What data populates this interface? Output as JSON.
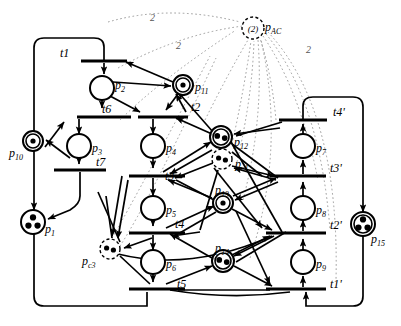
{
  "figure": {
    "kind": "petri-net",
    "width": 401,
    "height": 326,
    "background": "#ffffff",
    "stroke": "#000000",
    "dotted_arc_color": "#9a9a9a"
  },
  "places": [
    {
      "id": "p1",
      "label": "p",
      "sub": "1",
      "cx": 33,
      "cy": 222,
      "r": 12,
      "tokens": 3,
      "style": "solid"
    },
    {
      "id": "p2",
      "label": "p",
      "sub": "2",
      "cx": 102,
      "cy": 88,
      "r": 12,
      "tokens": 0,
      "style": "solid"
    },
    {
      "id": "p3",
      "label": "p",
      "sub": "3",
      "cx": 79,
      "cy": 146,
      "r": 12,
      "tokens": 0,
      "style": "solid"
    },
    {
      "id": "p4",
      "label": "p",
      "sub": "4",
      "cx": 153,
      "cy": 146,
      "r": 12,
      "tokens": 0,
      "style": "solid"
    },
    {
      "id": "p5",
      "label": "p",
      "sub": "5",
      "cx": 153,
      "cy": 208,
      "r": 12,
      "tokens": 0,
      "style": "solid"
    },
    {
      "id": "p6",
      "label": "p",
      "sub": "6",
      "cx": 153,
      "cy": 262,
      "r": 12,
      "tokens": 0,
      "style": "solid"
    },
    {
      "id": "p7",
      "label": "p",
      "sub": "7",
      "cx": 303,
      "cy": 146,
      "r": 12,
      "tokens": 0,
      "style": "solid"
    },
    {
      "id": "p8",
      "label": "p",
      "sub": "8",
      "cx": 303,
      "cy": 208,
      "r": 12,
      "tokens": 0,
      "style": "solid"
    },
    {
      "id": "p9",
      "label": "p",
      "sub": "9",
      "cx": 303,
      "cy": 262,
      "r": 12,
      "tokens": 0,
      "style": "solid"
    },
    {
      "id": "p10",
      "label": "p",
      "sub": "10",
      "cx": 33,
      "cy": 141,
      "r": 10,
      "tokens": 1,
      "style": "double"
    },
    {
      "id": "p11",
      "label": "p",
      "sub": "11",
      "cx": 183,
      "cy": 85,
      "r": 10,
      "tokens": 1,
      "style": "double"
    },
    {
      "id": "p12",
      "label": "p",
      "sub": "12",
      "cx": 221,
      "cy": 137,
      "r": 11,
      "tokens": 2,
      "style": "double"
    },
    {
      "id": "p13",
      "label": "p",
      "sub": "13",
      "cx": 223,
      "cy": 203,
      "r": 10,
      "tokens": 1,
      "style": "double"
    },
    {
      "id": "p14",
      "label": "p",
      "sub": "14",
      "cx": 223,
      "cy": 261,
      "r": 11,
      "tokens": 2,
      "style": "double"
    },
    {
      "id": "p15",
      "label": "p",
      "sub": "15",
      "cx": 363,
      "cy": 224,
      "r": 12,
      "tokens": 3,
      "style": "double"
    },
    {
      "id": "pc1",
      "label": "p",
      "sub": "c1",
      "cx": 222,
      "cy": 159,
      "r": 10,
      "tokens": 2,
      "style": "dashed"
    },
    {
      "id": "pc3",
      "label": "p",
      "sub": "c3",
      "cx": 110,
      "cy": 249,
      "r": 10,
      "tokens": 2,
      "style": "dashed"
    },
    {
      "id": "pAC",
      "label": "p",
      "sub": "AC",
      "cx": 253,
      "cy": 28,
      "r": 11,
      "tokens": 0,
      "style": "dashed",
      "inner_text": "(2)"
    }
  ],
  "transitions": [
    {
      "id": "t1",
      "label": "t1",
      "cx": 104,
      "cy": 61,
      "w": 46,
      "h": 3
    },
    {
      "id": "t6",
      "label": "t6",
      "cx": 104,
      "cy": 117,
      "w": 54,
      "h": 3
    },
    {
      "id": "t7",
      "label": "t7",
      "cx": 80,
      "cy": 170,
      "w": 52,
      "h": 3
    },
    {
      "id": "t2",
      "label": "t2",
      "cx": 163,
      "cy": 117,
      "w": 50,
      "h": 3
    },
    {
      "id": "t3",
      "label": "t3",
      "cx": 157,
      "cy": 176,
      "w": 56,
      "h": 3
    },
    {
      "id": "t4",
      "label": "t4",
      "cx": 157,
      "cy": 233,
      "w": 56,
      "h": 3
    },
    {
      "id": "t5",
      "label": "t5",
      "cx": 157,
      "cy": 289,
      "w": 56,
      "h": 3
    },
    {
      "id": "t4'",
      "label": "t4'",
      "cx": 303,
      "cy": 120,
      "w": 48,
      "h": 3
    },
    {
      "id": "t3'",
      "label": "t3'",
      "cx": 298,
      "cy": 176,
      "w": 56,
      "h": 3
    },
    {
      "id": "t2'",
      "label": "t2'",
      "cx": 296,
      "cy": 233,
      "w": 60,
      "h": 3
    },
    {
      "id": "t1'",
      "label": "t1'",
      "cx": 296,
      "cy": 289,
      "w": 60,
      "h": 3
    }
  ],
  "arc_weights": [
    {
      "text": "2",
      "x": 150,
      "y": 12
    },
    {
      "text": "2",
      "x": 176,
      "y": 40
    },
    {
      "text": "2",
      "x": 306,
      "y": 44
    }
  ],
  "place_label_offsets": {
    "p1": {
      "dx": 12,
      "dy": 8
    },
    "p2": {
      "dx": 13,
      "dy": -2
    },
    "p3": {
      "dx": 13,
      "dy": 3
    },
    "p4": {
      "dx": 13,
      "dy": 3
    },
    "p5": {
      "dx": 13,
      "dy": 3
    },
    "p6": {
      "dx": 13,
      "dy": 3
    },
    "p7": {
      "dx": 13,
      "dy": 3
    },
    "p8": {
      "dx": 13,
      "dy": 3
    },
    "p9": {
      "dx": 13,
      "dy": 3
    },
    "p10": {
      "dx": -24,
      "dy": 13
    },
    "p11": {
      "dx": 12,
      "dy": 3
    },
    "p12": {
      "dx": 13,
      "dy": 6
    },
    "p13": {
      "dx": -8,
      "dy": -12
    },
    "p14": {
      "dx": -8,
      "dy": -12
    },
    "p15": {
      "dx": 8,
      "dy": 16
    },
    "pc1": {
      "dx": 13,
      "dy": 6
    },
    "pc3": {
      "dx": -28,
      "dy": 13
    },
    "pAC": {
      "dx": 12,
      "dy": 0
    }
  },
  "transition_label_offsets": {
    "t1": {
      "dx": -44,
      "dy": -2
    },
    "t6": {
      "dx": -2,
      "dy": -2
    },
    "t7": {
      "dx": 16,
      "dy": -2
    },
    "t2": {
      "dx": 28,
      "dy": -4
    },
    "t3": {
      "dx": 8,
      "dy": 6
    },
    "t4": {
      "dx": 18,
      "dy": -3
    },
    "t5": {
      "dx": 20,
      "dy": 1
    },
    "t4'": {
      "dx": 30,
      "dy": -2
    },
    "t3'": {
      "dx": 32,
      "dy": -2
    },
    "t2'": {
      "dx": 34,
      "dy": -2
    },
    "t1'": {
      "dx": 34,
      "dy": 1
    }
  }
}
